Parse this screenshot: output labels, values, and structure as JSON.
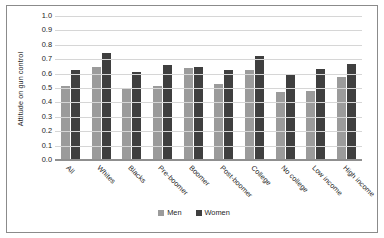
{
  "chart_data": {
    "type": "bar",
    "title": "",
    "xlabel": "",
    "ylabel": "Attitude on gun control",
    "ylim": [
      0.0,
      1.0
    ],
    "ytick_step": 0.1,
    "grid": true,
    "legend_position": "bottom",
    "yticks": [
      "1.0",
      "0.9",
      "0.8",
      "0.7",
      "0.6",
      "0.5",
      "0.4",
      "0.3",
      "0.2",
      "0.1",
      "0.0"
    ],
    "categories": [
      "All",
      "Whites",
      "Blacks",
      "Pre-boomer",
      "Boomer",
      "Post-boomer",
      "College",
      "No college",
      "Low income",
      "High income"
    ],
    "series": [
      {
        "name": "Men",
        "color": "#9b9b9b",
        "values": [
          0.505,
          0.64,
          0.49,
          0.505,
          0.63,
          0.52,
          0.615,
          0.465,
          0.475,
          0.57
        ]
      },
      {
        "name": "Women",
        "color": "#3f3f3f",
        "values": [
          0.62,
          0.735,
          0.605,
          0.65,
          0.64,
          0.62,
          0.715,
          0.585,
          0.625,
          0.66
        ]
      }
    ]
  },
  "legend": {
    "items": [
      {
        "label": "Men"
      },
      {
        "label": "Women"
      }
    ]
  },
  "colors": {
    "men": "#9b9b9b",
    "women": "#3f3f3f",
    "grid": "#d6d6d6",
    "axis": "#8f8f8f",
    "frame": "#8b8b8b",
    "background": "#ffffff"
  }
}
